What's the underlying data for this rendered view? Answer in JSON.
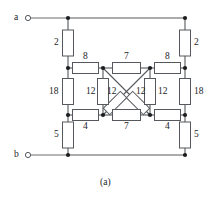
{
  "figure": {
    "caption": "(a)",
    "caption_pos": {
      "x": 100,
      "y": 178
    },
    "width": 218,
    "height": 199,
    "background": "#ffffff",
    "wire_color": "#55585c",
    "node_color": "#1b1d1f",
    "text_color": "#1b1d1f"
  },
  "terminals": [
    {
      "name": "a",
      "label": "a",
      "label_pos": {
        "x": 14,
        "y": 13
      },
      "circle": {
        "cx": 28,
        "cy": 18,
        "r": 2.6
      },
      "wire_to": {
        "x": 68,
        "y": 18
      }
    },
    {
      "name": "b",
      "label": "b",
      "label_pos": {
        "x": 14,
        "y": 150
      },
      "circle": {
        "cx": 28,
        "cy": 155,
        "r": 2.6
      },
      "wire_to": {
        "x": 68,
        "y": 155
      }
    }
  ],
  "nodes": [
    {
      "name": "top-left-node",
      "x": 68,
      "y": 18
    },
    {
      "name": "top-right-node",
      "x": 185,
      "y": 18
    },
    {
      "name": "mid-upper-left-node",
      "x": 68,
      "y": 68
    },
    {
      "name": "bridge-top-left-node",
      "x": 103,
      "y": 68
    },
    {
      "name": "bridge-top-right-node",
      "x": 150,
      "y": 68
    },
    {
      "name": "mid-upper-right-node",
      "x": 185,
      "y": 68
    },
    {
      "name": "mid-lower-left-node",
      "x": 68,
      "y": 115
    },
    {
      "name": "bridge-bottom-left-node",
      "x": 103,
      "y": 115
    },
    {
      "name": "bridge-bottom-right-node",
      "x": 150,
      "y": 115
    },
    {
      "name": "mid-lower-right-node",
      "x": 185,
      "y": 115
    },
    {
      "name": "bottom-left-node",
      "x": 68,
      "y": 155
    },
    {
      "name": "bottom-right-node",
      "x": 185,
      "y": 155
    }
  ],
  "resistors": [
    {
      "id": "r-left-top",
      "value": "2",
      "orient": "v",
      "cx": 68,
      "cy": 43,
      "w": 11,
      "h": 26,
      "label_pos": {
        "x": 54,
        "y": 38
      }
    },
    {
      "id": "r-right-top",
      "value": "2",
      "orient": "v",
      "cx": 185,
      "cy": 43,
      "w": 11,
      "h": 26,
      "label_pos": {
        "x": 194,
        "y": 38
      }
    },
    {
      "id": "r-left-mid",
      "value": "18",
      "orient": "v",
      "cx": 68,
      "cy": 91.5,
      "w": 11,
      "h": 26,
      "label_pos": {
        "x": 49,
        "y": 87
      }
    },
    {
      "id": "r-right-mid",
      "value": "18",
      "orient": "v",
      "cx": 185,
      "cy": 91.5,
      "w": 11,
      "h": 26,
      "label_pos": {
        "x": 194,
        "y": 87
      }
    },
    {
      "id": "r-left-bot",
      "value": "5",
      "orient": "v",
      "cx": 68,
      "cy": 135,
      "w": 11,
      "h": 26,
      "label_pos": {
        "x": 54,
        "y": 130
      }
    },
    {
      "id": "r-right-bot",
      "value": "5",
      "orient": "v",
      "cx": 185,
      "cy": 135,
      "w": 11,
      "h": 26,
      "label_pos": {
        "x": 194,
        "y": 130
      }
    },
    {
      "id": "r-top-left-8",
      "value": "8",
      "orient": "h",
      "cx": 85.5,
      "cy": 68,
      "w": 26,
      "h": 11,
      "label_pos": {
        "x": 83,
        "y": 52
      }
    },
    {
      "id": "r-top-mid-7",
      "value": "7",
      "orient": "h",
      "cx": 126.5,
      "cy": 68,
      "w": 28,
      "h": 11,
      "label_pos": {
        "x": 124,
        "y": 52
      }
    },
    {
      "id": "r-top-right-8",
      "value": "8",
      "orient": "h",
      "cx": 167.5,
      "cy": 68,
      "w": 26,
      "h": 11,
      "label_pos": {
        "x": 165,
        "y": 52
      }
    },
    {
      "id": "r-bot-left-4",
      "value": "4",
      "orient": "h",
      "cx": 85.5,
      "cy": 115,
      "w": 26,
      "h": 11,
      "label_pos": {
        "x": 83,
        "y": 122
      }
    },
    {
      "id": "r-bot-mid-7",
      "value": "7",
      "orient": "h",
      "cx": 126.5,
      "cy": 115,
      "w": 28,
      "h": 11,
      "label_pos": {
        "x": 124,
        "y": 122
      }
    },
    {
      "id": "r-bot-right-4",
      "value": "4",
      "orient": "h",
      "cx": 167.5,
      "cy": 115,
      "w": 26,
      "h": 11,
      "label_pos": {
        "x": 165,
        "y": 122
      }
    },
    {
      "id": "r-bridge-left-12",
      "value": "12",
      "orient": "v",
      "cx": 103,
      "cy": 91.5,
      "w": 11,
      "h": 26,
      "label_pos": {
        "x": 86,
        "y": 87
      }
    },
    {
      "id": "r-bridge-right-12",
      "value": "12",
      "orient": "v",
      "cx": 150,
      "cy": 91.5,
      "w": 11,
      "h": 26,
      "label_pos": {
        "x": 158,
        "y": 87
      }
    }
  ],
  "diagonals": [
    {
      "id": "diag-tl-br",
      "value": "12",
      "from": {
        "x": 103,
        "y": 68
      },
      "to": {
        "x": 150,
        "y": 115
      },
      "box_center": {
        "x": 138,
        "y": 103
      },
      "box_len": 24,
      "box_wid": 9,
      "label_pos": {
        "x": 136,
        "y": 87
      }
    },
    {
      "id": "diag-tr-bl",
      "value": "12",
      "from": {
        "x": 150,
        "y": 68
      },
      "to": {
        "x": 103,
        "y": 115
      },
      "box_center": {
        "x": 115,
        "y": 103
      },
      "box_len": 24,
      "box_wid": 9,
      "label_pos": {
        "x": 107,
        "y": 87
      }
    }
  ],
  "wires": [
    {
      "name": "wire-top-rail",
      "x1": 68,
      "y1": 18,
      "x2": 185,
      "y2": 18
    },
    {
      "name": "wire-bottom-rail",
      "x1": 68,
      "y1": 155,
      "x2": 185,
      "y2": 155
    },
    {
      "name": "wire-left-col-seg1",
      "x1": 68,
      "y1": 18,
      "x2": 68,
      "y2": 30
    },
    {
      "name": "wire-left-col-seg2",
      "x1": 68,
      "y1": 56,
      "x2": 68,
      "y2": 68
    },
    {
      "name": "wire-left-col-seg3",
      "x1": 68,
      "y1": 68,
      "x2": 68,
      "y2": 78.5
    },
    {
      "name": "wire-left-col-seg4",
      "x1": 68,
      "y1": 104.5,
      "x2": 68,
      "y2": 115
    },
    {
      "name": "wire-left-col-seg5",
      "x1": 68,
      "y1": 115,
      "x2": 68,
      "y2": 122
    },
    {
      "name": "wire-left-col-seg6",
      "x1": 68,
      "y1": 148,
      "x2": 68,
      "y2": 155
    },
    {
      "name": "wire-right-col-seg1",
      "x1": 185,
      "y1": 18,
      "x2": 185,
      "y2": 30
    },
    {
      "name": "wire-right-col-seg2",
      "x1": 185,
      "y1": 56,
      "x2": 185,
      "y2": 68
    },
    {
      "name": "wire-right-col-seg3",
      "x1": 185,
      "y1": 68,
      "x2": 185,
      "y2": 78.5
    },
    {
      "name": "wire-right-col-seg4",
      "x1": 185,
      "y1": 104.5,
      "x2": 185,
      "y2": 115
    },
    {
      "name": "wire-right-col-seg5",
      "x1": 185,
      "y1": 115,
      "x2": 185,
      "y2": 122
    },
    {
      "name": "wire-right-col-seg6",
      "x1": 185,
      "y1": 148,
      "x2": 185,
      "y2": 155
    },
    {
      "name": "wire-mid-upper-a",
      "x1": 68,
      "y1": 68,
      "x2": 72.5,
      "y2": 68
    },
    {
      "name": "wire-mid-upper-b",
      "x1": 98.5,
      "y1": 68,
      "x2": 112.5,
      "y2": 68
    },
    {
      "name": "wire-mid-upper-c",
      "x1": 140.5,
      "y1": 68,
      "x2": 154.5,
      "y2": 68
    },
    {
      "name": "wire-mid-upper-d",
      "x1": 180.5,
      "y1": 68,
      "x2": 185,
      "y2": 68
    },
    {
      "name": "wire-mid-lower-a",
      "x1": 68,
      "y1": 115,
      "x2": 72.5,
      "y2": 115
    },
    {
      "name": "wire-mid-lower-b",
      "x1": 98.5,
      "y1": 115,
      "x2": 112.5,
      "y2": 115
    },
    {
      "name": "wire-mid-lower-c",
      "x1": 140.5,
      "y1": 115,
      "x2": 154.5,
      "y2": 115
    },
    {
      "name": "wire-mid-lower-d",
      "x1": 180.5,
      "y1": 115,
      "x2": 185,
      "y2": 115
    },
    {
      "name": "wire-bridge-left-seg1",
      "x1": 103,
      "y1": 68,
      "x2": 103,
      "y2": 78.5
    },
    {
      "name": "wire-bridge-left-seg2",
      "x1": 103,
      "y1": 104.5,
      "x2": 103,
      "y2": 115
    },
    {
      "name": "wire-bridge-right-seg1",
      "x1": 150,
      "y1": 68,
      "x2": 150,
      "y2": 78.5
    },
    {
      "name": "wire-bridge-right-seg2",
      "x1": 150,
      "y1": 104.5,
      "x2": 150,
      "y2": 115
    }
  ],
  "chart_data": {
    "type": "diagram",
    "title": "(a)",
    "units": "ohms",
    "resistor_values": [
      "2",
      "2",
      "18",
      "18",
      "5",
      "5",
      "8",
      "7",
      "8",
      "4",
      "7",
      "4",
      "12",
      "12",
      "12",
      "12"
    ],
    "terminals": [
      "a",
      "b"
    ]
  }
}
